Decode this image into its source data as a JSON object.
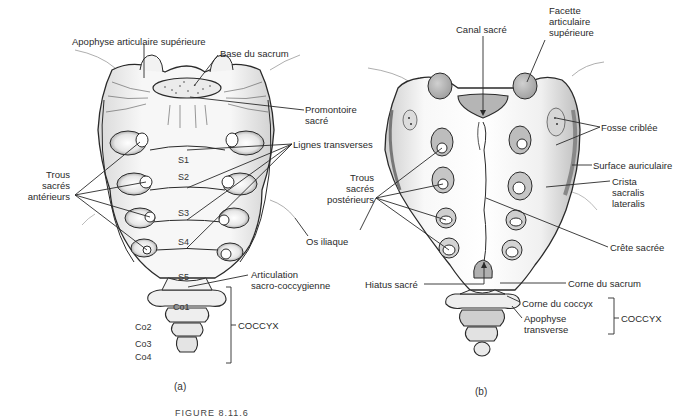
{
  "panel_a": {
    "caption": "(a)",
    "view": "anterior",
    "labels": {
      "apophyse_articulaire_superieure": "Apophyse articulaire supérieure",
      "base_du_sacrum": "Base du sacrum",
      "promontoire_line1": "Promontoire",
      "promontoire_line2": "sacré",
      "lignes_transverses": "Lignes transverses",
      "trous_anterieurs_line1": "Trous",
      "trous_anterieurs_line2": "sacrés",
      "trous_anterieurs_line3": "antérieurs",
      "os_iliaque": "Os iliaque",
      "articulation_line1": "Articulation",
      "articulation_line2": "sacro-coccygienne",
      "coccyx": "COCCYX"
    },
    "segments": [
      "S1",
      "S2",
      "S3",
      "S4",
      "S5",
      "Co1",
      "Co2",
      "Co3",
      "Co4"
    ]
  },
  "panel_b": {
    "caption": "(b)",
    "view": "posterior",
    "labels": {
      "canal_sacre": "Canal sacré",
      "facette_line1": "Facette",
      "facette_line2": "articulaire",
      "facette_line3": "supérieure",
      "fosse_criblee": "Fosse criblée",
      "surface_auriculaire": "Surface auriculaire",
      "crista_line1": "Crista",
      "crista_line2": "sacralis",
      "crista_line3": "lateralis",
      "trous_posterieurs_line1": "Trous",
      "trous_posterieurs_line2": "sacrés",
      "trous_posterieurs_line3": "postérieurs",
      "crete_sacree": "Crête sacrée",
      "hiatus_sacre": "Hiatus sacré",
      "corne_du_sacrum": "Corne du sacrum",
      "corne_du_coccyx": "Corne du coccyx",
      "apophyse_transverse_line1": "Apophyse",
      "apophyse_transverse_line2": "transverse",
      "coccyx": "COCCYX"
    }
  },
  "figure_caption": "FIGURE 8.11.6",
  "colors": {
    "ink": "#2a2a2a",
    "bone_fill": "#f3f3f3",
    "bone_shade": "#c9c9c9",
    "facet_fill": "#bdbdbd",
    "background": "#ffffff"
  }
}
